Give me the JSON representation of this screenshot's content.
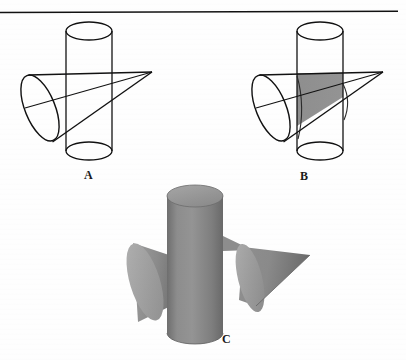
{
  "figure": {
    "background_color": "#fefefe",
    "stroke_color": "#111111",
    "rule": {
      "name": "top-horizontal-rule",
      "x1": 0,
      "y1": 12,
      "x2": 398,
      "y2": 11,
      "stroke_width": 1.4
    },
    "panels": [
      {
        "id": "A",
        "label": "A",
        "label_x": 84,
        "label_y": 169,
        "description": "Wireframe cone passing through a wireframe cylinder, no shading",
        "shaded": false,
        "shade_color": "none"
      },
      {
        "id": "B",
        "label": "B",
        "label_x": 300,
        "label_y": 170,
        "description": "Same wireframe cone and cylinder with the intersection solid shaded gray",
        "shaded": true,
        "shade_color": "#8d8d8d"
      },
      {
        "id": "C",
        "label": "C",
        "label_x": 222,
        "label_y": 333,
        "description": "Solid shaded rendering: gray cylinder with the cone split into a left frustum piece and a right tip piece",
        "shaded": true,
        "shade_color": "#878787"
      }
    ],
    "colors": {
      "line": "#111111",
      "intersection_gray": "#8d8d8d",
      "cylinder_body": "#848484",
      "cylinder_top": "#9a9a9a",
      "cone_light": "#a2a2a2",
      "cone_mid": "#8a8a8a",
      "cone_dark": "#6f6f6f",
      "white": "#ffffff"
    },
    "geometry": {
      "panel_a": {
        "cylinder": {
          "top_ellipse": {
            "cx": 89,
            "cy": 31,
            "rx": 23,
            "ry": 9
          },
          "bottom_ellipse": {
            "cx": 89,
            "cy": 151,
            "rx": 23,
            "ry": 9
          },
          "left_x": 66,
          "right_x": 112
        },
        "cone": {
          "base_ellipse": {
            "cx": 40,
            "cy": 108,
            "rx": 15,
            "ry": 35,
            "rotation": -22
          },
          "apex_x": 152,
          "apex_y": 72
        }
      },
      "panel_b": {
        "cylinder": {
          "top_ellipse": {
            "cx": 320,
            "cy": 31,
            "rx": 23,
            "ry": 9
          },
          "bottom_ellipse": {
            "cx": 320,
            "cy": 151,
            "rx": 23,
            "ry": 9
          },
          "left_x": 297,
          "right_x": 343
        },
        "cone": {
          "base_ellipse": {
            "cx": 271,
            "cy": 108,
            "rx": 15,
            "ry": 35,
            "rotation": -22
          },
          "apex_x": 383,
          "apex_y": 72
        }
      },
      "panel_c": {
        "cylinder": {
          "top_ellipse": {
            "cx": 195,
            "cy": 196,
            "rx": 28,
            "ry": 11
          },
          "bottom_ellipse": {
            "cx": 195,
            "cy": 333,
            "rx": 28,
            "ry": 11
          },
          "left_x": 167,
          "right_x": 223
        },
        "left_cone_piece": {
          "base_ellipse": {
            "cx": 145,
            "cy": 281,
            "rx": 15,
            "ry": 40,
            "rotation": -18
          },
          "cut_x": 175
        },
        "right_cone_piece": {
          "base_ellipse": {
            "cx": 251,
            "cy": 282,
            "rx": 13,
            "ry": 37,
            "rotation": -15
          },
          "apex_x": 310,
          "apex_y": 253
        },
        "sliver": {
          "description": "small cone apex sliver emerging right of the cylinder",
          "points": "223,236 250,249 223,249"
        }
      }
    }
  }
}
